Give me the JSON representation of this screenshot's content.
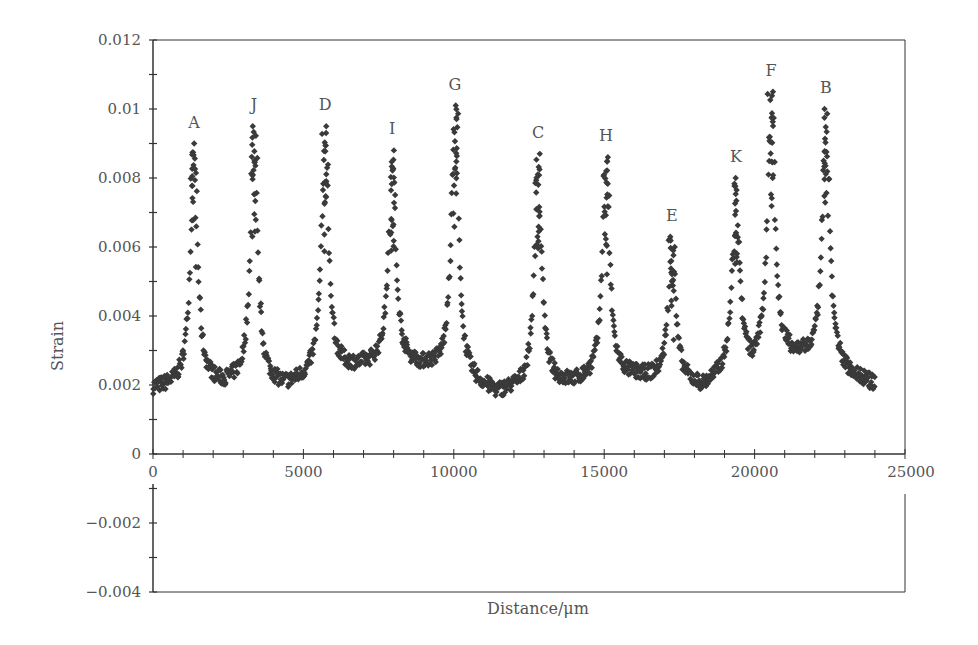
{
  "chart_data": {
    "type": "scatter",
    "title": "",
    "xlabel": "Distance/μm",
    "ylabel": "Strain",
    "xlim": [
      0,
      25000
    ],
    "ylim": [
      -0.004,
      0.012
    ],
    "x_ticks": [
      0,
      5000,
      10000,
      15000,
      20000,
      25000
    ],
    "x_tick_labels": [
      "0",
      "5000",
      "10000",
      "15000",
      "20000",
      "25000"
    ],
    "y_ticks": [
      0.012,
      0.01,
      0.008,
      0.006,
      0.004,
      0.002,
      0,
      -0.002,
      -0.004
    ],
    "y_tick_labels": [
      "0.012",
      "0.01",
      "0.008",
      "0.006",
      "0.004",
      "0.002",
      "0",
      "−0.002",
      "−0.004"
    ],
    "grid": false,
    "legend": null,
    "marker": "diamond",
    "marker_color": "#3a3a3a",
    "baseline_strain_range": [
      0.0018,
      0.0032
    ],
    "x_data_range": [
      0,
      24000
    ],
    "peaks": [
      {
        "label": "A",
        "x": 1360,
        "strain": 0.009
      },
      {
        "label": "J",
        "x": 3360,
        "strain": 0.0095
      },
      {
        "label": "D",
        "x": 5720,
        "strain": 0.0095
      },
      {
        "label": "I",
        "x": 7950,
        "strain": 0.0088
      },
      {
        "label": "G",
        "x": 10040,
        "strain": 0.0101
      },
      {
        "label": "C",
        "x": 12800,
        "strain": 0.0087
      },
      {
        "label": "H",
        "x": 15060,
        "strain": 0.0086
      },
      {
        "label": "E",
        "x": 17250,
        "strain": 0.0063
      },
      {
        "label": "K",
        "x": 19380,
        "strain": 0.008
      },
      {
        "label": "F",
        "x": 20550,
        "strain": 0.0105
      },
      {
        "label": "B",
        "x": 22370,
        "strain": 0.01
      }
    ],
    "valleys": [
      {
        "x": 0,
        "strain": 0.0019
      },
      {
        "x": 2600,
        "strain": 0.0021
      },
      {
        "x": 4300,
        "strain": 0.002
      },
      {
        "x": 6900,
        "strain": 0.0026
      },
      {
        "x": 9100,
        "strain": 0.0026
      },
      {
        "x": 11400,
        "strain": 0.0018
      },
      {
        "x": 13900,
        "strain": 0.0021
      },
      {
        "x": 16200,
        "strain": 0.0023
      },
      {
        "x": 18300,
        "strain": 0.002
      },
      {
        "x": 20000,
        "strain": 0.0027
      },
      {
        "x": 21500,
        "strain": 0.0029
      },
      {
        "x": 24000,
        "strain": 0.002
      }
    ]
  }
}
